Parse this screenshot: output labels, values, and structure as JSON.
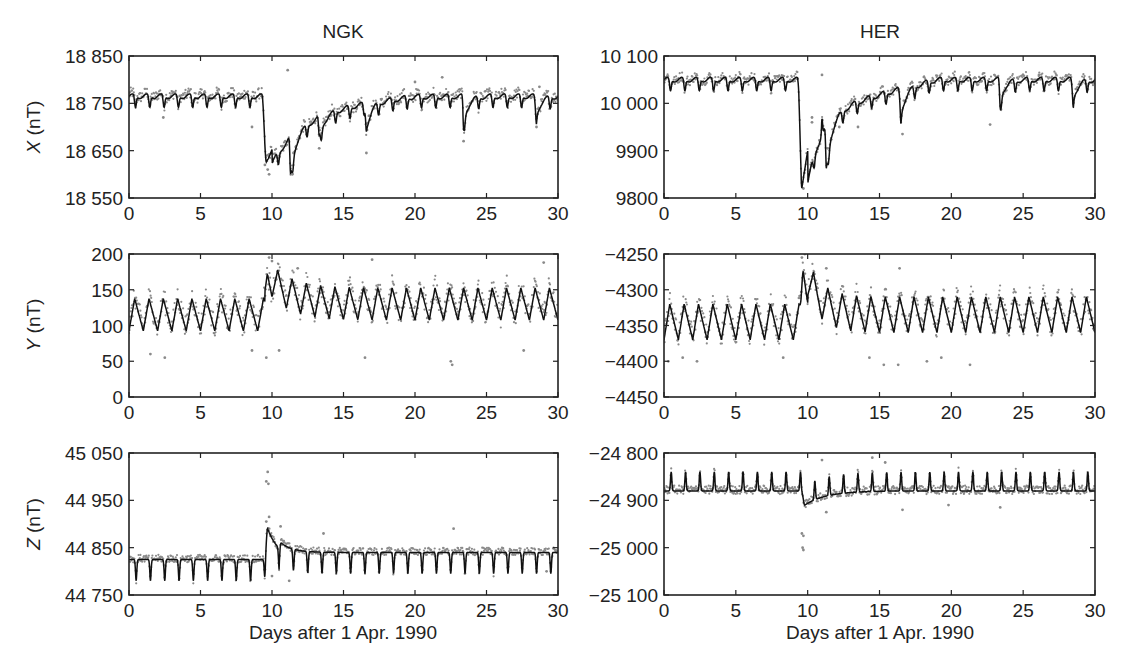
{
  "figure": {
    "columns": [
      {
        "station": "NGK"
      },
      {
        "station": "HER"
      }
    ],
    "xlabel": "Days after 1 Apr. 1990",
    "colors": {
      "model_line": "#111111",
      "observed_dots": "#8a8a8a",
      "axes": "#222222"
    }
  },
  "chart_data": [
    {
      "type": "line",
      "panel": "NGK-X",
      "title": "NGK",
      "ylabel": "X (nT)",
      "ylabel_var": "X",
      "ylabel_unit": " (nT)",
      "xlabel": "",
      "xlim": [
        0,
        30
      ],
      "ylim": [
        18550,
        18850
      ],
      "xticks": [
        0,
        5,
        10,
        15,
        20,
        25,
        30
      ],
      "yticks": [
        18550,
        18650,
        18750,
        18850
      ],
      "ytick_labels": [
        "18 550",
        "18 650",
        "18 750",
        "18 850"
      ],
      "grid": false,
      "series": [
        {
          "name": "model",
          "style": "line",
          "baseline": 18765,
          "daily_amp": 25,
          "daily_shape": "dip",
          "storm": {
            "day": 9.6,
            "depth": -135,
            "recovery_days": 2.2
          },
          "extra_dips": [
            [
              11.3,
              -80
            ],
            [
              13.3,
              -40
            ],
            [
              16.6,
              -55
            ],
            [
              23.4,
              -55
            ],
            [
              28.5,
              -40
            ]
          ],
          "slow_recovery": {
            "start": 10,
            "end": 20,
            "offset": -30
          }
        },
        {
          "name": "observed",
          "style": "scatter",
          "noise": 12,
          "outliers": [
            [
              9.7,
              18610
            ],
            [
              9.8,
              18600
            ],
            [
              9.5,
              18620
            ],
            [
              11.1,
              18820
            ],
            [
              16.6,
              18645
            ],
            [
              13.3,
              18655
            ],
            [
              11.5,
              18645
            ],
            [
              23.4,
              18670
            ],
            [
              20,
              18795
            ],
            [
              21.9,
              18805
            ],
            [
              2.4,
              18720
            ],
            [
              8.6,
              18700
            ],
            [
              28.5,
              18700
            ],
            [
              28.7,
              18785
            ]
          ]
        }
      ]
    },
    {
      "type": "line",
      "panel": "HER-X",
      "title": "HER",
      "ylabel": "",
      "xlim": [
        0,
        30
      ],
      "ylim": [
        9800,
        10100
      ],
      "xticks": [
        0,
        5,
        10,
        15,
        20,
        25,
        30
      ],
      "yticks": [
        9800,
        9900,
        10000,
        10100
      ],
      "ytick_labels": [
        "9800",
        "9900",
        "10 000",
        "10 100"
      ],
      "grid": false,
      "series": [
        {
          "name": "model",
          "style": "line",
          "baseline": 10050,
          "daily_amp": 25,
          "daily_shape": "dip",
          "storm": {
            "day": 9.6,
            "depth": -225,
            "recovery_days": 1.0
          },
          "extra_dips": [
            [
              11.3,
              -90
            ],
            [
              16.5,
              -55
            ],
            [
              23.4,
              -45
            ],
            [
              28.5,
              -40
            ]
          ],
          "spikes": [
            [
              11.0,
              35
            ]
          ],
          "slow_recovery": {
            "start": 10,
            "end": 19,
            "offset": -70
          }
        },
        {
          "name": "observed",
          "style": "scatter",
          "noise": 10,
          "outliers": [
            [
              9.7,
              9820
            ],
            [
              10.3,
              9970
            ],
            [
              10.3,
              9960
            ],
            [
              11.0,
              10060
            ],
            [
              11.4,
              9905
            ],
            [
              16.6,
              9935
            ],
            [
              12.2,
              9950
            ],
            [
              13.5,
              9950
            ],
            [
              22.7,
              9955
            ],
            [
              26.1,
              10060
            ]
          ]
        }
      ]
    },
    {
      "type": "line",
      "panel": "NGK-Y",
      "title": "",
      "ylabel": "Y (nT)",
      "ylabel_var": "Y",
      "ylabel_unit": " (nT)",
      "xlim": [
        0,
        30
      ],
      "ylim": [
        0,
        200
      ],
      "xticks": [
        0,
        5,
        10,
        15,
        20,
        25,
        30
      ],
      "yticks": [
        0,
        50,
        100,
        150,
        200
      ],
      "ytick_labels": [
        "0",
        "50",
        "100",
        "150",
        "200"
      ],
      "grid": false,
      "series": [
        {
          "name": "model",
          "style": "line",
          "baseline": 115,
          "daily_amp": 45,
          "daily_shape": "sawtooth",
          "storm": {
            "day": 9.7,
            "depth": 40,
            "recovery_days": 1.5
          },
          "slow_recovery": {
            "start": 9.5,
            "end": 30,
            "offset": 15
          }
        },
        {
          "name": "observed",
          "style": "scatter",
          "noise": 15,
          "outliers": [
            [
              9.8,
              195
            ],
            [
              10.0,
              190
            ],
            [
              9.6,
              55
            ],
            [
              17.0,
              192
            ],
            [
              16.5,
              55
            ],
            [
              22.5,
              50
            ],
            [
              22.6,
              45
            ],
            [
              29.0,
              188
            ],
            [
              1.5,
              60
            ],
            [
              2.5,
              55
            ],
            [
              8.6,
              65
            ],
            [
              10.5,
              65
            ],
            [
              27.6,
              65
            ],
            [
              11.8,
              180
            ]
          ]
        }
      ]
    },
    {
      "type": "line",
      "panel": "HER-Y",
      "title": "",
      "ylabel": "",
      "xlim": [
        0,
        30
      ],
      "ylim": [
        -4450,
        -4250
      ],
      "xticks": [
        0,
        5,
        10,
        15,
        20,
        25,
        30
      ],
      "yticks": [
        -4450,
        -4400,
        -4350,
        -4300,
        -4250
      ],
      "ytick_labels": [
        "−4450",
        "−4400",
        "−4350",
        "−4300",
        "−4250"
      ],
      "grid": false,
      "series": [
        {
          "name": "model",
          "style": "line",
          "baseline": -4345,
          "daily_amp": 50,
          "daily_shape": "sawtooth",
          "storm": {
            "day": 9.7,
            "depth": 70,
            "recovery_days": 1.0
          },
          "slow_recovery": {
            "start": 10,
            "end": 30,
            "offset": 10
          }
        },
        {
          "name": "observed",
          "style": "scatter",
          "noise": 14,
          "outliers": [
            [
              9.6,
              -4255
            ],
            [
              9.8,
              -4250
            ],
            [
              11.3,
              -4270
            ],
            [
              16.4,
              -4270
            ],
            [
              0.3,
              -4400
            ],
            [
              1.3,
              -4395
            ],
            [
              2.3,
              -4400
            ],
            [
              8.3,
              -4395
            ],
            [
              14.3,
              -4395
            ],
            [
              15.3,
              -4405
            ],
            [
              16.3,
              -4405
            ],
            [
              21.3,
              -4405
            ],
            [
              18.3,
              -4400
            ],
            [
              19.3,
              -4395
            ]
          ]
        }
      ]
    },
    {
      "type": "line",
      "panel": "NGK-Z",
      "title": "",
      "ylabel": "Z (nT)",
      "ylabel_var": "Z",
      "ylabel_unit": " (nT)",
      "xlabel": "Days after 1 Apr. 1990",
      "xlim": [
        0,
        30
      ],
      "ylim": [
        44750,
        45050
      ],
      "xticks": [
        0,
        5,
        10,
        15,
        20,
        25,
        30
      ],
      "yticks": [
        44750,
        44850,
        44950,
        45050
      ],
      "ytick_labels": [
        "44 750",
        "44 850",
        "44 950",
        "45 050"
      ],
      "grid": false,
      "series": [
        {
          "name": "model",
          "style": "line",
          "baseline": 44825,
          "daily_amp": 45,
          "daily_shape": "narrowdip",
          "storm": {
            "day": 9.7,
            "depth": 65,
            "recovery_days": 0.8
          },
          "slow_recovery": {
            "start": 10.5,
            "end": 30,
            "offset": 15
          }
        },
        {
          "name": "observed",
          "style": "scatter",
          "noise": 8,
          "outliers": [
            [
              9.7,
              45010
            ],
            [
              9.6,
              44990
            ],
            [
              9.75,
              44985
            ],
            [
              9.8,
              44915
            ],
            [
              9.6,
              44905
            ],
            [
              10.6,
              44895
            ],
            [
              13.6,
              44880
            ],
            [
              22.7,
              44890
            ],
            [
              11.2,
              44780
            ],
            [
              10.0,
              44790
            ],
            [
              29.2,
              44800
            ]
          ]
        }
      ]
    },
    {
      "type": "line",
      "panel": "HER-Z",
      "title": "",
      "ylabel": "",
      "xlabel": "Days after 1 Apr. 1990",
      "xlim": [
        0,
        30
      ],
      "ylim": [
        -25100,
        -24800
      ],
      "xticks": [
        0,
        5,
        10,
        15,
        20,
        25,
        30
      ],
      "yticks": [
        -25100,
        -25000,
        -24900,
        -24800
      ],
      "ytick_labels": [
        "−25 100",
        "−25 000",
        "−24 900",
        "−24 800"
      ],
      "grid": false,
      "series": [
        {
          "name": "model",
          "style": "line",
          "baseline": -24880,
          "daily_amp": -40,
          "daily_shape": "narrowdip",
          "storm": {
            "day": 9.8,
            "depth": -30,
            "recovery_days": 1.5
          },
          "slow_recovery": {
            "start": 10,
            "end": 30,
            "offset": 0
          }
        },
        {
          "name": "observed",
          "style": "scatter",
          "noise": 9,
          "outliers": [
            [
              9.6,
              -24970
            ],
            [
              9.7,
              -24975
            ],
            [
              9.7,
              -25005
            ],
            [
              9.65,
              -25000
            ],
            [
              14.5,
              -24810
            ],
            [
              15.4,
              -24820
            ],
            [
              11.0,
              -24815
            ],
            [
              16.6,
              -24920
            ],
            [
              11.3,
              -24925
            ],
            [
              23.4,
              -24915
            ],
            [
              19.8,
              -24910
            ]
          ]
        }
      ]
    }
  ]
}
